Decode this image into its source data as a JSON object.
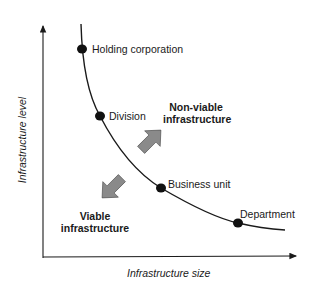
{
  "diagram": {
    "axes": {
      "y_label": "Infrastructure level",
      "x_label": "Infrastructure size"
    },
    "curve_points": [
      {
        "label": "Holding corporation"
      },
      {
        "label": "Division"
      },
      {
        "label": "Business unit"
      },
      {
        "label": "Department"
      }
    ],
    "regions": {
      "upper": {
        "line1": "Non-viable",
        "line2": "infrastructure"
      },
      "lower": {
        "line1": "Viable",
        "line2": "infrastructure"
      }
    },
    "colors": {
      "line": "#1a1a1a",
      "arrow_fill": "#8a8a8a",
      "dot": "#111111"
    }
  }
}
